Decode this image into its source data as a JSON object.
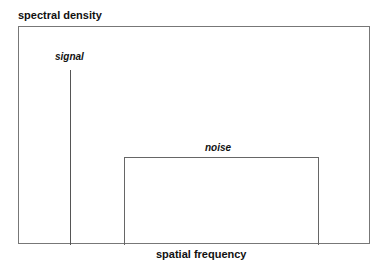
{
  "chart_data": {
    "type": "diagram",
    "title": "",
    "ylabel": "spectral density",
    "xlabel": "spatial frequency",
    "elements": [
      {
        "name": "signal",
        "shape": "impulse",
        "x_rel": 0.15,
        "height_rel": 0.8
      },
      {
        "name": "noise",
        "shape": "rectangle",
        "x_start_rel": 0.3,
        "x_end_rel": 0.85,
        "height_rel": 0.4
      }
    ]
  },
  "labels": {
    "ylabel": "spectral density",
    "xlabel": "spatial frequency",
    "signal": "signal",
    "noise": "noise"
  }
}
